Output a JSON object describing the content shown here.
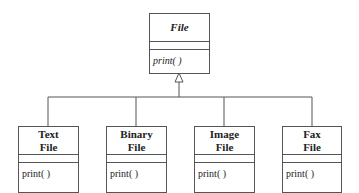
{
  "diagram": {
    "type": "UML class diagram (inheritance)",
    "parent": {
      "name": "File",
      "abstract": true,
      "methods": [
        "print( )"
      ]
    },
    "children": [
      {
        "name_line1": "Text",
        "name_line2": "File",
        "methods": [
          "print( )"
        ]
      },
      {
        "name_line1": "Binary",
        "name_line2": "File",
        "methods": [
          "print( )"
        ]
      },
      {
        "name_line1": "Image",
        "name_line2": "File",
        "methods": [
          "print( )"
        ]
      },
      {
        "name_line1": "Fax",
        "name_line2": "File",
        "methods": [
          "print( )"
        ]
      }
    ],
    "relationship": "generalization",
    "colors": {
      "line": "#555555",
      "background": "#ffffff",
      "text": "#222222"
    }
  }
}
